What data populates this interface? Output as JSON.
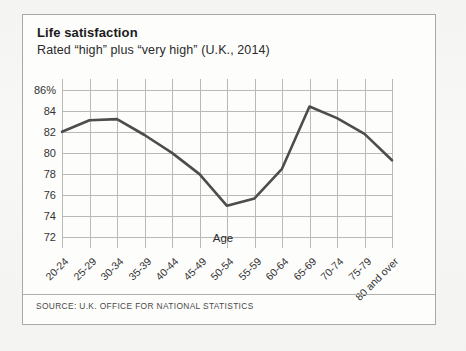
{
  "card": {
    "title": "Life satisfaction",
    "subtitle": "Rated “high” plus “very high” (U.K., 2014)",
    "source": "SOURCE: U.K. OFFICE FOR NATIONAL STATISTICS"
  },
  "chart_data": {
    "type": "line",
    "title": "Life satisfaction",
    "subtitle": "Rated “high” plus “very high” (U.K., 2014)",
    "xlabel": "Age",
    "ylabel": "",
    "ylim": [
      71,
      87
    ],
    "yticks": [
      86,
      84,
      82,
      80,
      78,
      76,
      74,
      72
    ],
    "ytick_labels": [
      "86%",
      "84",
      "82",
      "80",
      "78",
      "76",
      "74",
      "72"
    ],
    "grid": true,
    "legend": false,
    "line_color": "#4d4d4d",
    "categories": [
      "20-24",
      "25-29",
      "30-34",
      "35-39",
      "40-44",
      "45-49",
      "50-54",
      "55-59",
      "60-64",
      "65-69",
      "70-74",
      "75-79",
      "80 and over"
    ],
    "values": [
      82.0,
      83.1,
      83.2,
      81.7,
      80.0,
      78.0,
      75.0,
      75.7,
      78.5,
      84.4,
      83.3,
      81.8,
      79.3
    ]
  }
}
